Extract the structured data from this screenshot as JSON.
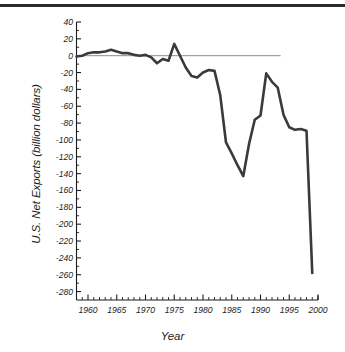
{
  "figure": {
    "has_top_rule": true,
    "background_color": "#ffffff",
    "line_color": "#3a3a3a",
    "axis_color": "#1c1c1c",
    "zero_line_color": "#6b6b6b"
  },
  "chart_data": {
    "type": "line",
    "title": "",
    "xlabel": "Year",
    "ylabel": "U.S. Net Exports (billion dollars)",
    "xlim": [
      1958,
      2000
    ],
    "ylim": [
      -290,
      40
    ],
    "ytick_step": 20,
    "xtick_major_step": 5,
    "xtick_minor_step": 1,
    "grid": false,
    "legend": null,
    "zero_reference_line": {
      "y": 0,
      "x_start": 1958,
      "x_end": 1993.5
    },
    "ytick_labels": [
      "40",
      "20",
      "0",
      "-20",
      "-40",
      "-60",
      "-80",
      "-100",
      "-120",
      "-140",
      "-160",
      "-180",
      "-200",
      "-220",
      "-240",
      "-260",
      "-280"
    ],
    "ytick_values": [
      40,
      20,
      0,
      -20,
      -40,
      -60,
      -80,
      -100,
      -120,
      -140,
      -160,
      -180,
      -200,
      -220,
      -240,
      -260,
      -280
    ],
    "xtick_labels": [
      "1960",
      "1965",
      "1970",
      "1975",
      "1980",
      "1985",
      "1990",
      "1995",
      "2000"
    ],
    "xtick_values": [
      1960,
      1965,
      1970,
      1975,
      1980,
      1985,
      1990,
      1995,
      2000
    ],
    "x": [
      1958,
      1959,
      1960,
      1961,
      1962,
      1963,
      1964,
      1965,
      1966,
      1967,
      1968,
      1969,
      1970,
      1971,
      1972,
      1973,
      1974,
      1975,
      1976,
      1977,
      1978,
      1979,
      1980,
      1981,
      1982,
      1983,
      1984,
      1985,
      1986,
      1987,
      1988,
      1989,
      1990,
      1991,
      1992,
      1993,
      1994,
      1995,
      1996,
      1997,
      1998,
      1999
    ],
    "values": [
      -1,
      0,
      3,
      4,
      4,
      5,
      7,
      5,
      3,
      3,
      1,
      0,
      1,
      -2,
      -9,
      -4,
      -6,
      14,
      0,
      -14,
      -24,
      -26,
      -20,
      -17,
      -18,
      -47,
      -103,
      -116,
      -130,
      -143,
      -105,
      -76,
      -71,
      -21,
      -31,
      -38,
      -70,
      -85,
      -88,
      -87,
      -89,
      -258
    ],
    "series": [
      {
        "name": "U.S. Net Exports",
        "values": [
          -1,
          0,
          3,
          4,
          4,
          5,
          7,
          5,
          3,
          3,
          1,
          0,
          1,
          -2,
          -9,
          -4,
          -6,
          14,
          0,
          -14,
          -24,
          -26,
          -20,
          -17,
          -18,
          -47,
          -103,
          -116,
          -130,
          -143,
          -105,
          -76,
          -71,
          -21,
          -31,
          -38,
          -70,
          -85,
          -88,
          -87,
          -89,
          -258
        ]
      }
    ]
  }
}
